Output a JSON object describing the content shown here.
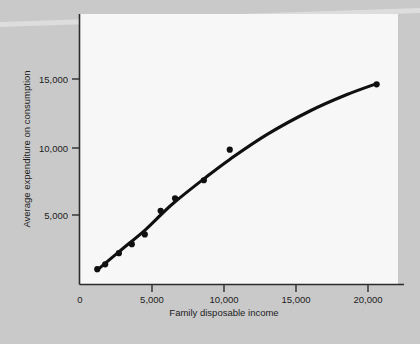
{
  "figure": {
    "background_color": "#c9c9c9",
    "panel_color": "#f7f7f7",
    "ink_color": "#101010"
  },
  "axes": {
    "x_title": "Family disposable income",
    "y_title": "Average expenditure on consumption",
    "x_ticks": [
      "0",
      "5,000",
      "10,000",
      "15,000",
      "20,000"
    ],
    "y_ticks": [
      "5,000",
      "10,000",
      "15,000"
    ]
  },
  "chart_data": {
    "type": "scatter",
    "title": "",
    "xlabel": "Family disposable income",
    "ylabel": "Average expenditure on consumption",
    "xlim": [
      0,
      21500
    ],
    "ylim": [
      0,
      16500
    ],
    "xticks": [
      0,
      5000,
      10000,
      15000,
      20000
    ],
    "xticklabels": [
      "0",
      "5,000",
      "10,000",
      "15,000",
      "20,000"
    ],
    "yticks": [
      5000,
      10000,
      15000
    ],
    "yticklabels": [
      "5,000",
      "10,000",
      "15,000"
    ],
    "grid": false,
    "legend": "none",
    "series": [
      {
        "name": "Observed families",
        "type": "scatter",
        "marker": "filled-circle",
        "color": "#101010",
        "points": [
          {
            "x": 1200,
            "y": 1100
          },
          {
            "x": 1750,
            "y": 1450
          },
          {
            "x": 2700,
            "y": 2250
          },
          {
            "x": 3600,
            "y": 2900
          },
          {
            "x": 4500,
            "y": 3600
          },
          {
            "x": 5600,
            "y": 5300
          },
          {
            "x": 6600,
            "y": 6200
          },
          {
            "x": 8600,
            "y": 7500
          },
          {
            "x": 10400,
            "y": 9700
          },
          {
            "x": 20600,
            "y": 14400
          }
        ]
      },
      {
        "name": "Fitted consumption function",
        "type": "line",
        "color": "#101010",
        "points": [
          {
            "x": 1150,
            "y": 1000
          },
          {
            "x": 2700,
            "y": 2350
          },
          {
            "x": 4500,
            "y": 3900
          },
          {
            "x": 5600,
            "y": 5000
          },
          {
            "x": 6600,
            "y": 5950
          },
          {
            "x": 8600,
            "y": 7600
          },
          {
            "x": 10400,
            "y": 9000
          },
          {
            "x": 13000,
            "y": 10800
          },
          {
            "x": 16000,
            "y": 12500
          },
          {
            "x": 18500,
            "y": 13650
          },
          {
            "x": 20600,
            "y": 14450
          }
        ]
      }
    ]
  }
}
